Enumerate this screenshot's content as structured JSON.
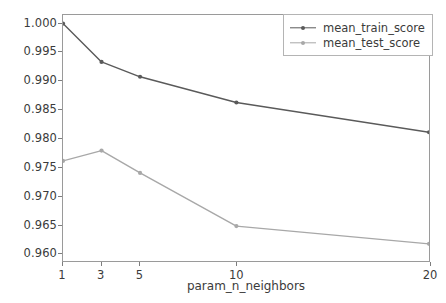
{
  "chart_data": {
    "type": "line",
    "title": "",
    "xlabel": "param_n_neighbors",
    "ylabel": "",
    "x": [
      1,
      3,
      5,
      10,
      20
    ],
    "xticklabels": [
      "1",
      "3",
      "5",
      "10",
      "20"
    ],
    "yticks": [
      0.96,
      0.965,
      0.97,
      0.975,
      0.98,
      0.985,
      0.99,
      0.995,
      1.0
    ],
    "yticklabels": [
      "0.960",
      "0.965",
      "0.970",
      "0.975",
      "0.980",
      "0.985",
      "0.990",
      "0.995",
      "1.000"
    ],
    "xlim": [
      1,
      20
    ],
    "ylim": [
      0.9585,
      1.0015
    ],
    "grid": false,
    "legend_position": "upper right",
    "series": [
      {
        "name": "mean_train_score",
        "color": "#5a5a5a",
        "marker": "point",
        "values": [
          1.0,
          0.9933,
          0.9907,
          0.9862,
          0.981
        ]
      },
      {
        "name": "mean_test_score",
        "color": "#a8a8a8",
        "marker": "point",
        "values": [
          0.976,
          0.9778,
          0.9739,
          0.9646,
          0.9615
        ]
      }
    ]
  },
  "legend": {
    "entries": [
      {
        "label": "mean_train_score"
      },
      {
        "label": "mean_test_score"
      }
    ]
  },
  "colors": {
    "background": "#ffffff",
    "axis": "#9a9a9a",
    "text": "#3b3b3b",
    "train": "#5a5a5a",
    "test": "#a8a8a8"
  }
}
